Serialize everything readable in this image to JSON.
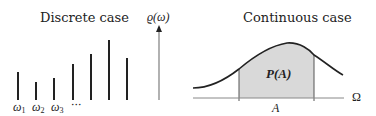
{
  "discrete": {
    "title": "Discrete case",
    "axis_label": "ϱ(ω)",
    "labels": [
      "ω",
      "ω",
      "ω"
    ],
    "subscripts": [
      "1",
      "2",
      "3"
    ],
    "ellipsis": "···",
    "bars": [
      {
        "x": 18,
        "top": 72
      },
      {
        "x": 36,
        "top": 82
      },
      {
        "x": 54,
        "top": 78
      },
      {
        "x": 73,
        "top": 64
      },
      {
        "x": 91,
        "top": 54
      },
      {
        "x": 109,
        "top": 40
      },
      {
        "x": 127,
        "top": 58
      }
    ],
    "baseline": 100
  },
  "continuous": {
    "title": "Continuous case",
    "region_label": "P(A)",
    "set_label": "A",
    "space_label": "Ω",
    "shade_color": "#d9d9d9"
  }
}
